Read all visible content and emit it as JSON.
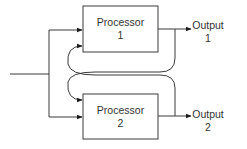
{
  "diagram": {
    "type": "block-diagram",
    "colors": {
      "stroke": "#3a3a3a",
      "box_fill": "#ffffff",
      "text": "#333333",
      "background": "#ffffff"
    },
    "nodes": [
      {
        "id": "processor1",
        "line1": "Processor",
        "line2": "1"
      },
      {
        "id": "processor2",
        "line1": "Processor",
        "line2": "2"
      }
    ],
    "outputs": [
      {
        "id": "output1",
        "line1": "Output",
        "line2": "1"
      },
      {
        "id": "output2",
        "line1": "Output",
        "line2": "2"
      }
    ],
    "edges": [
      {
        "from": "input",
        "to": "processor1"
      },
      {
        "from": "input",
        "to": "processor2"
      },
      {
        "from": "processor1",
        "to": "output1"
      },
      {
        "from": "processor2",
        "to": "output2"
      },
      {
        "from": "processor1",
        "to": "processor2",
        "kind": "feedback-curve"
      },
      {
        "from": "processor2",
        "to": "processor1",
        "kind": "feedback-curve"
      }
    ]
  }
}
